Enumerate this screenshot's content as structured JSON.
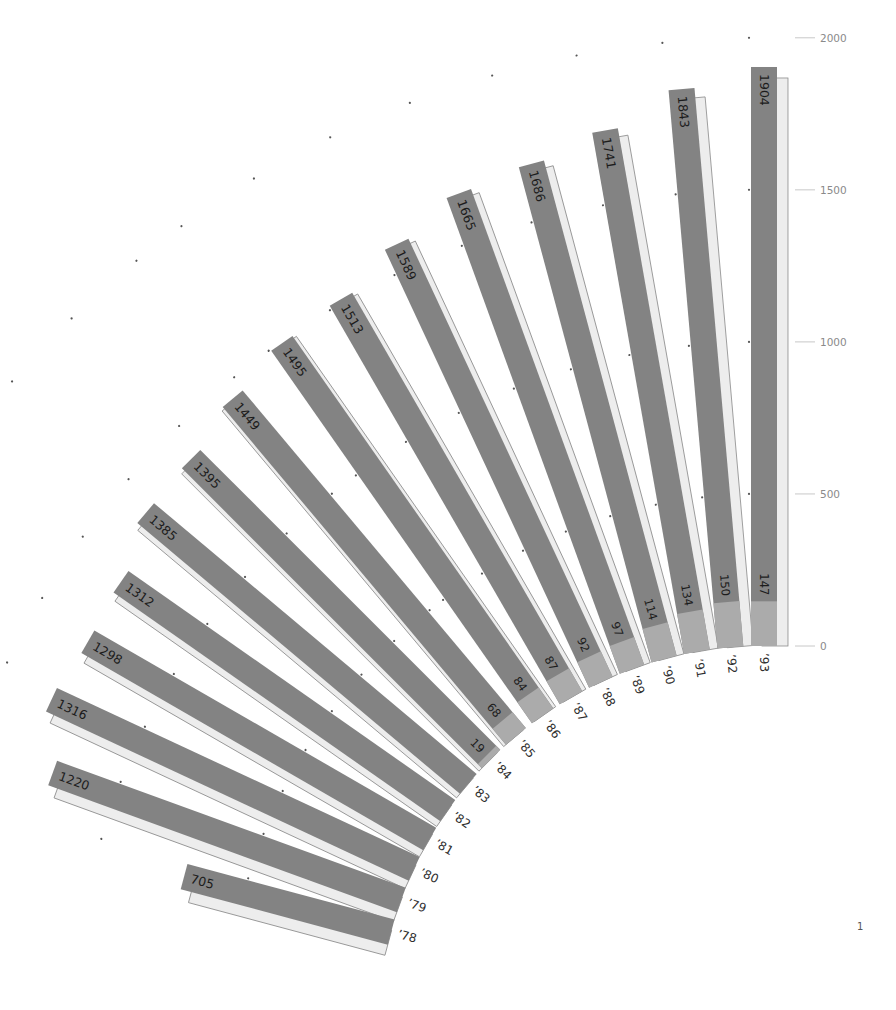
{
  "chart_data": {
    "type": "bar",
    "layout": "radial-fan",
    "title": "",
    "xlabel": "",
    "ylabel": "",
    "categories": [
      "’78",
      "’79",
      "’80",
      "’81",
      "’82",
      "’83",
      "’84",
      "’85",
      "’86",
      "’87",
      "’88",
      "’89",
      "’90",
      "’91",
      "’92",
      "’93"
    ],
    "series": [
      {
        "name": "total",
        "values": [
          705,
          1220,
          1316,
          1298,
          1312,
          1385,
          1395,
          1449,
          1495,
          1513,
          1589,
          1665,
          1686,
          1741,
          1843,
          1904
        ]
      },
      {
        "name": "highlighted",
        "values": [
          null,
          null,
          null,
          null,
          null,
          null,
          19,
          68,
          84,
          87,
          92,
          97,
          114,
          134,
          150,
          147
        ]
      }
    ],
    "axis": {
      "ticks": [
        0,
        500,
        1000,
        1500,
        2000
      ],
      "tick_labels": [
        "0",
        "500",
        "1000",
        "1500",
        "2000"
      ],
      "position": "right"
    },
    "ylim": [
      0,
      2000
    ],
    "grid": "dot markers at 500, 1000, 1500, 2000 beside each bar",
    "legend": null,
    "colors": {
      "bar": "#838383",
      "highlight": "#ababab",
      "shadow": "#ededed",
      "shadow_stroke": "#8c8c8c",
      "dot": "#555555",
      "tick": "#c8c8c8"
    }
  },
  "page": {
    "number": "1"
  }
}
